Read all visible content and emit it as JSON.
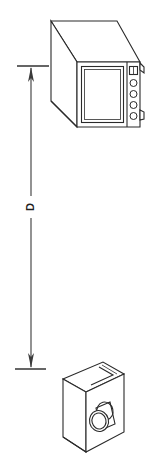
{
  "diagram": {
    "type": "technical-line-drawing",
    "dimension": {
      "label": "D",
      "label_rotation_deg": -90,
      "orientation": "vertical",
      "arrow_top_y": 66,
      "arrow_bottom_y": 369,
      "line_x": 31,
      "extension_top": {
        "y": 66,
        "x_start": 17,
        "x_end": 49
      },
      "extension_bottom": {
        "y": 369,
        "x_start": 15,
        "x_end": 46
      },
      "arrowheads": "both-ends"
    },
    "objects": [
      {
        "id": "display-unit",
        "name": "oscilloscope-display-unit",
        "position": "top",
        "projection": "oblique",
        "features": [
          "rectangular-screen",
          "control-panel",
          "four-round-knobs",
          "rectangular-button",
          "side-tabs"
        ],
        "knob_count": 4,
        "button_count": 1
      },
      {
        "id": "sensor-head",
        "name": "laser-sensor-head",
        "position": "bottom",
        "projection": "oblique",
        "features": [
          "elongated-body",
          "top-groove-slot",
          "cylindrical-lens-barrel"
        ],
        "lens_count": 1
      }
    ],
    "colors": {
      "stroke": "#2a2a2a",
      "dimension_stroke": "#4a4a4a",
      "fill": "#ffffff",
      "background": "#ffffff",
      "label_fill": "#1f1f1f"
    }
  }
}
